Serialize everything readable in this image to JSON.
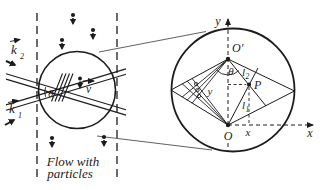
{
  "figure": {
    "type": "physics-diagram",
    "left_panel": {
      "k2_label": "k",
      "k2_sub": "2",
      "k1_label": "k",
      "k1_sub": "1",
      "theta_label": "θ",
      "velocity_label": "v",
      "caption_line1": "Flow with",
      "caption_line2": "particles"
    },
    "right_panel": {
      "y_axis_label": "y",
      "x_axis_label": "x",
      "origin_prime_label": "O′",
      "origin_label": "O",
      "point_label": "P",
      "theta_label": "θ",
      "l2_label": "l",
      "l2_sub": "2",
      "l1_label": "l",
      "l1_sub": "1",
      "y_coord_label": "y",
      "x_coord_label": "x"
    },
    "colors": {
      "ink": "#1c1c1c",
      "background": "#ffffff"
    }
  }
}
